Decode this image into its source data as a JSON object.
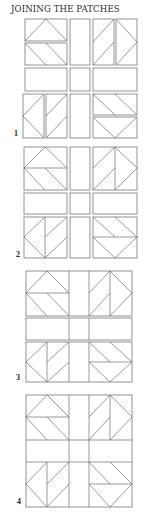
{
  "title": "JOINING THE PATCHES",
  "colors": {
    "line": "#6e6e6e",
    "text": "#2a2a2a",
    "background": "#ffffff"
  },
  "diagrams": [
    {
      "label": "1",
      "label_pos": [
        14,
        129
      ],
      "step": "separate halves and sashing pieces"
    },
    {
      "label": "2",
      "label_pos": [
        16,
        250
      ],
      "step": "halves joined into blocks"
    },
    {
      "label": "3",
      "label_pos": [
        16,
        373
      ],
      "step": "blocks and sashing joined into rows"
    },
    {
      "label": "4",
      "label_pos": [
        17,
        497
      ],
      "step": "rows joined into finished block"
    }
  ]
}
